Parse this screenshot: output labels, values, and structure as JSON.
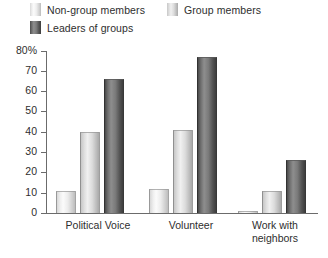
{
  "legend": {
    "items": [
      {
        "label": "Non-group members",
        "color": "#ededed",
        "series_key": "non_group_members"
      },
      {
        "label": "Group members",
        "color": "#dcdcdc",
        "series_key": "group_members"
      },
      {
        "label": "Leaders of groups",
        "color": "#6a6a6a",
        "series_key": "leaders_of_groups"
      }
    ]
  },
  "axis": {
    "y_ticks": [
      "80%",
      "70",
      "60",
      "50",
      "40",
      "30",
      "20",
      "10",
      "0"
    ],
    "y_tick_values": [
      80,
      70,
      60,
      50,
      40,
      30,
      20,
      10,
      0
    ]
  },
  "chart_data": {
    "type": "bar",
    "title": "",
    "subtitle": "",
    "xlabel": "",
    "ylabel": "",
    "ylim": [
      0,
      80
    ],
    "grid": false,
    "legend_position": "top-left",
    "categories": [
      "Political Voice",
      "Volunteer",
      "Work with\nneighbors"
    ],
    "series": [
      {
        "name": "Non-group members",
        "values": [
          11,
          12,
          1
        ],
        "color": "#ededed"
      },
      {
        "name": "Group members",
        "values": [
          40,
          41,
          11
        ],
        "color": "#dcdcdc"
      },
      {
        "name": "Leaders of groups",
        "values": [
          66,
          77,
          26
        ],
        "color": "#6a6a6a"
      }
    ]
  }
}
